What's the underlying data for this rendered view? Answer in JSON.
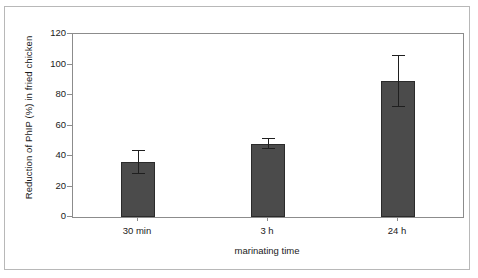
{
  "chart_data": {
    "type": "bar",
    "title": "",
    "xlabel": "marinating time",
    "ylabel": "Reduction of PhIP (%) in fried chicken",
    "categories": [
      "30 min",
      "3 h",
      "24 h"
    ],
    "values": [
      36,
      48,
      89
    ],
    "errors_upper": [
      44,
      52,
      106
    ],
    "errors_lower": [
      29,
      45,
      73
    ],
    "ylim": [
      0,
      120
    ],
    "ytick_labels": [
      "0",
      "20",
      "40",
      "60",
      "80",
      "100",
      "120"
    ],
    "ytick_values": [
      0,
      20,
      40,
      60,
      80,
      100,
      120
    ],
    "grid": false,
    "legend": false,
    "bar_color": "#4b4b4b",
    "axis_color": "#8c8c8c",
    "error_color": "#1f1f1f"
  },
  "axes": {
    "y_title": "Reduction of PhIP (%) in fried chicken",
    "x_title": "marinating time",
    "y_ticks": [
      {
        "label": "120"
      },
      {
        "label": "100"
      },
      {
        "label": "80"
      },
      {
        "label": "60"
      },
      {
        "label": "40"
      },
      {
        "label": "20"
      },
      {
        "label": "0"
      }
    ],
    "x_ticks": [
      {
        "label": "30 min"
      },
      {
        "label": "3 h"
      },
      {
        "label": "24 h"
      }
    ]
  }
}
